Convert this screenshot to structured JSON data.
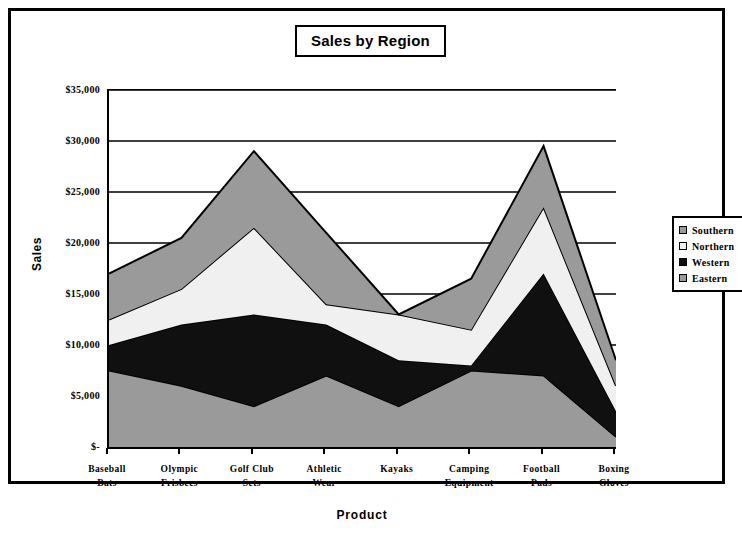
{
  "chart_data": {
    "type": "area",
    "stacked": true,
    "title": "Sales by Region",
    "xlabel": "Product",
    "ylabel": "Sales",
    "ylim": [
      0,
      35000
    ],
    "ytick_labels": [
      "$-",
      "$5,000",
      "$10,000",
      "$15,000",
      "$20,000",
      "$25,000",
      "$30,000",
      "$35,000"
    ],
    "ytick_values": [
      0,
      5000,
      10000,
      15000,
      20000,
      25000,
      30000,
      35000
    ],
    "grid": true,
    "legend_position": "right",
    "categories": [
      "Baseball Bats",
      "Olympic Frisbees",
      "Golf Club Sets",
      "Athletic Wear",
      "Kayaks",
      "Camping Equipment",
      "Football Pads",
      "Boxing Gloves"
    ],
    "category_lines": [
      [
        "Baseball",
        "Bats"
      ],
      [
        "Olympic",
        "Frisbees"
      ],
      [
        "Golf Club",
        "Sets"
      ],
      [
        "Athletic",
        "Wear"
      ],
      [
        "Kayaks",
        ""
      ],
      [
        "Camping",
        "Equipment"
      ],
      [
        "Football",
        "Pads"
      ],
      [
        "Boxing",
        "Gloves"
      ]
    ],
    "series": [
      {
        "name": "Eastern",
        "order": 1,
        "color": "#9a9a9a",
        "values": [
          7500,
          6000,
          4000,
          7000,
          4000,
          7500,
          7000,
          1000
        ]
      },
      {
        "name": "Western",
        "order": 2,
        "color": "#101010",
        "values": [
          2500,
          6000,
          9000,
          5000,
          4500,
          500,
          10000,
          2500
        ]
      },
      {
        "name": "Northern",
        "order": 3,
        "color": "#f0f0f0",
        "values": [
          2500,
          3500,
          8500,
          2000,
          4500,
          3500,
          6500,
          2500
        ]
      },
      {
        "name": "Southern",
        "order": 4,
        "color": "#9a9a9a",
        "values": [
          4500,
          5000,
          7500,
          7000,
          0,
          5000,
          6000,
          2500
        ]
      }
    ],
    "cumulative_totals": [
      17000,
      20500,
      29000,
      21000,
      13500,
      16500,
      29500,
      8500
    ]
  },
  "legend": {
    "entries": [
      {
        "label": "Southern",
        "key": "legend-key-southern"
      },
      {
        "label": "Northern",
        "key": "legend-key-northern"
      },
      {
        "label": "Western",
        "key": "legend-key-western"
      },
      {
        "label": "Eastern",
        "key": "legend-key-eastern"
      }
    ]
  },
  "colors": {
    "gray": "#9a9a9a",
    "black": "#101010",
    "white": "#f0f0f0",
    "outline": "#000000",
    "background": "#ffffff"
  }
}
